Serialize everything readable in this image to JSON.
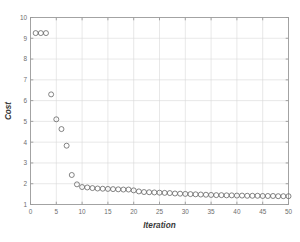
{
  "figure": {
    "background_color": "#ffffff",
    "axes_color": "#9a9a9a",
    "grid_color": "#d8d8d8",
    "marker_color": "#5c5c5c",
    "label_color": "#3a3a3a",
    "tick_color": "#6d6d6d"
  },
  "chart_data": {
    "type": "scatter",
    "title": "",
    "xlabel": "Iteration",
    "ylabel": "Cost",
    "xlim": [
      0,
      50
    ],
    "ylim": [
      1,
      10
    ],
    "xticks": [
      0,
      5,
      10,
      15,
      20,
      25,
      30,
      35,
      40,
      45,
      50
    ],
    "xticklabels": [
      "0",
      "5",
      "10",
      "15",
      "20",
      "25",
      "30",
      "35",
      "40",
      "45",
      "50"
    ],
    "yticks": [
      1,
      2,
      3,
      4,
      5,
      6,
      7,
      8,
      9,
      10
    ],
    "yticklabels": [
      "1",
      "2",
      "3",
      "4",
      "5",
      "6",
      "7",
      "8",
      "9",
      "10"
    ],
    "grid": true,
    "legend": null,
    "marker": "o",
    "marker_style": "open-circle",
    "x": [
      1,
      2,
      3,
      4,
      5,
      6,
      7,
      8,
      9,
      10,
      11,
      12,
      13,
      14,
      15,
      16,
      17,
      18,
      19,
      20,
      21,
      22,
      23,
      24,
      25,
      26,
      27,
      28,
      29,
      30,
      31,
      32,
      33,
      34,
      35,
      36,
      37,
      38,
      39,
      40,
      41,
      42,
      43,
      44,
      45,
      46,
      47,
      48,
      49,
      50
    ],
    "values": [
      9.25,
      9.25,
      9.25,
      6.3,
      5.1,
      4.63,
      3.83,
      2.42,
      1.97,
      1.84,
      1.82,
      1.79,
      1.77,
      1.76,
      1.75,
      1.74,
      1.73,
      1.72,
      1.72,
      1.68,
      1.63,
      1.6,
      1.59,
      1.58,
      1.57,
      1.56,
      1.55,
      1.53,
      1.52,
      1.51,
      1.5,
      1.49,
      1.48,
      1.47,
      1.46,
      1.45,
      1.45,
      1.44,
      1.44,
      1.43,
      1.43,
      1.42,
      1.42,
      1.42,
      1.41,
      1.41,
      1.41,
      1.4,
      1.4,
      1.4
    ]
  }
}
